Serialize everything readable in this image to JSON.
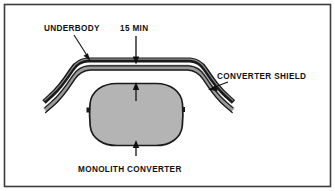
{
  "figure": {
    "border_color": "#3c3c3c",
    "background_color": "#ffffff",
    "labels": {
      "underbody": "UNDERBODY",
      "dimension": "15 MIN",
      "converter_shield": "CONVERTER SHIELD",
      "monolith_converter": "MONOLITH CONVERTER"
    },
    "parts": {
      "underbody_color": "#1a1a1a",
      "shield_color": "#9a9a9a",
      "converter_fill": "#b4b4b4",
      "converter_outline": "#1a1a1a",
      "tab_color": "#1a1a1a",
      "leader_color": "#111111"
    },
    "annotations": {
      "dimension_value": "15",
      "dimension_unit": "MIN",
      "dimension_note": "15 MIN clearance between underbody and monolith converter"
    }
  }
}
